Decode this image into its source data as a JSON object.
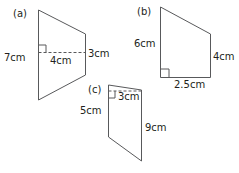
{
  "shapes": [
    {
      "id": "a",
      "tag": "(a)",
      "type": "trapezium",
      "labels": {
        "left_side": "7cm",
        "height": "4cm",
        "right_side": "3cm"
      }
    },
    {
      "id": "b",
      "tag": "(b)",
      "type": "right trapezium",
      "labels": {
        "left_side": "6cm",
        "right_side": "4cm",
        "base": "2.5cm"
      }
    },
    {
      "id": "c",
      "tag": "(c)",
      "type": "trapezium",
      "labels": {
        "left_side": "5cm",
        "height": "3cm",
        "right_side": "9cm"
      }
    }
  ],
  "colors": {
    "line": "#58595b",
    "text": "#231f20"
  }
}
